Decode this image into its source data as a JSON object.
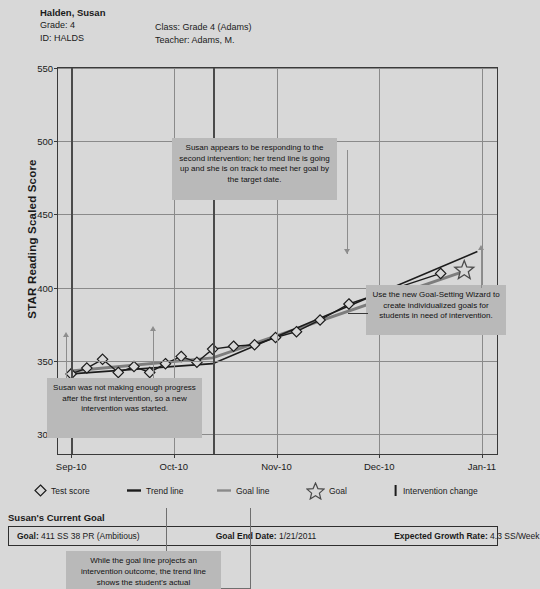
{
  "student": {
    "name": "Halden, Susan",
    "grade_label": "Grade: 4",
    "id_label": "ID: HALDS",
    "class_label": "Class: Grade 4 (Adams)",
    "teacher_label": "Teacher: Adams, M."
  },
  "chart_data": {
    "type": "line",
    "title": "",
    "xlabel": "",
    "ylabel": "STAR Reading Scaled Score",
    "ylim": [
      285,
      550
    ],
    "yticks": [
      550,
      500,
      450,
      400,
      350,
      300
    ],
    "xticks": [
      "Sep-10",
      "Oct-10",
      "Nov-10",
      "Dec-10",
      "Jan-11"
    ],
    "grid": true,
    "legend_position": "bottom",
    "series": [
      {
        "name": "Test score",
        "type": "scatter",
        "marker": "diamond",
        "x": [
          0.1,
          0.22,
          0.34,
          0.46,
          0.58,
          0.7,
          0.82,
          0.94,
          1.06,
          1.18,
          1.34,
          1.5,
          1.66,
          1.82,
          2.0,
          2.22,
          2.48,
          2.92
        ],
        "values": [
          340,
          344,
          350,
          341,
          345,
          341,
          347,
          352,
          348,
          357,
          359,
          360,
          365,
          369,
          377,
          388,
          396,
          409
        ]
      },
      {
        "name": "Trend line",
        "type": "line",
        "color": "#1c1c1c",
        "x": [
          0.1,
          1.18,
          1.18,
          3.2
        ],
        "values": [
          340,
          347,
          347,
          424
        ]
      },
      {
        "name": "Goal line",
        "type": "line",
        "color": "#7d7d7d",
        "x": [
          0.1,
          1.18,
          1.18,
          3.12
        ],
        "values": [
          342,
          351,
          351,
          411
        ]
      },
      {
        "name": "Goal",
        "type": "marker",
        "marker": "star",
        "x": [
          3.1
        ],
        "values": [
          411
        ]
      },
      {
        "name": "Intervention change",
        "type": "vline",
        "x": [
          0.1,
          1.18
        ],
        "values": [
          null,
          null
        ]
      }
    ]
  },
  "legend": [
    {
      "label": "Test score",
      "icon": "diamond-icon"
    },
    {
      "label": "Trend line",
      "icon": "dark-line-icon"
    },
    {
      "label": "Goal line",
      "icon": "gray-line-icon"
    },
    {
      "label": "Goal",
      "icon": "star-icon"
    },
    {
      "label": "Intervention change",
      "icon": "vertical-bar-icon"
    }
  ],
  "callouts": [
    {
      "id": "responding",
      "text": "Susan appears to be responding to the second intervention; her trend line is going up and she is on track to meet her goal by the target date."
    },
    {
      "id": "goal-wizard",
      "text": "Use the new Goal-Setting Wizard to create individualized goals for students in need of intervention."
    },
    {
      "id": "not-enough-progress",
      "text": "Susan was not making enough progress after the first intervention, so a new intervention was started."
    },
    {
      "id": "trend-vs-goal",
      "text": "While the goal line projects an intervention outcome, the trend line shows the student's actual"
    }
  ],
  "goal_panel": {
    "heading": "Susan's Current Goal",
    "goal_key": "Goal:",
    "goal_value": "411 SS 38 PR (Ambitious)",
    "end_date_key": "Goal End Date:",
    "end_date_value": "1/21/2011",
    "growth_key": "Expected Growth Rate:",
    "growth_value": "4.3 SS/Week"
  },
  "colors": {
    "page_bg": "#d8d8d8",
    "callout_bg": "#b9b9b9",
    "trend": "#1c1c1c",
    "goal": "#7d7d7d",
    "axis": "#3a3a3a",
    "grid": "#8a8a8a"
  }
}
